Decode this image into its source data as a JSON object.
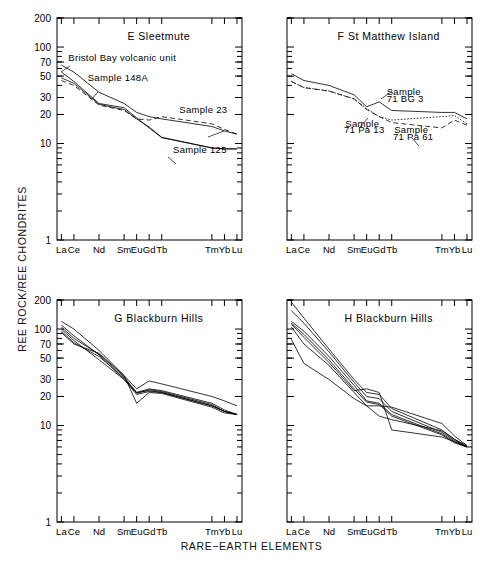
{
  "figure": {
    "xlabel": "RARE−EARTH ELEMENTS",
    "ylabel": "REE ROCK/REE CHONDRITES"
  },
  "axis": {
    "y_tick_labels": [
      "200",
      "100",
      "70",
      "50",
      "30",
      "20",
      "10",
      "1"
    ],
    "y_tick_values": [
      200,
      100,
      70,
      50,
      30,
      20,
      10,
      1
    ],
    "ylim": [
      1,
      200
    ],
    "yscale": "log",
    "x_tick_labels": [
      "La",
      "Ce",
      "Nd",
      "Sm",
      "Eu",
      "Gd",
      "Tb",
      "Tm",
      "Yb",
      "Lu"
    ],
    "x_positions": [
      0,
      1,
      3,
      5,
      6,
      7,
      8,
      12,
      13,
      14
    ],
    "xlim": [
      -0.35,
      14.4
    ]
  },
  "chart_data": [
    {
      "type": "line",
      "panel": "E",
      "title": "E   Sleetmute",
      "xlabel": "RARE−EARTH ELEMENTS",
      "ylabel": "REE ROCK/REE CHONDRITES",
      "yscale": "log",
      "ylim": [
        1,
        200
      ],
      "grid": false,
      "categories": [
        "La",
        "Ce",
        "Nd",
        "Sm",
        "Eu",
        "Gd",
        "Tb",
        "Tm",
        "Yb",
        "Lu"
      ],
      "annotations": [
        {
          "text": "Bristol Bay volcanic unit",
          "x": 0.55,
          "y": 72
        },
        {
          "text": "Sample 148A",
          "x": 2.1,
          "y": 44
        },
        {
          "text": "Sample 23",
          "x": 9.4,
          "y": 20.5
        },
        {
          "text": "Sample 125",
          "x": 8.9,
          "y": 8.0
        }
      ],
      "series": [
        {
          "name": "Bristol Bay volcanic unit",
          "style": "solid",
          "values": [
            65,
            55,
            34,
            26,
            21,
            19,
            18,
            15,
            13.5,
            12.5
          ]
        },
        {
          "name": "Sample 148A",
          "style": "solid",
          "values": [
            55,
            44,
            26,
            23.5,
            18.5,
            14.5,
            11.5,
            9.0,
            8.8,
            8.8
          ]
        },
        {
          "name": "Sample 23",
          "style": "dashed",
          "values": [
            45,
            40,
            25,
            22,
            18,
            17.5,
            19,
            16,
            14,
            12.5
          ]
        },
        {
          "name": "Sample 125",
          "style": "solid",
          "values": [
            48,
            42,
            25.5,
            22.5,
            18,
            14.8,
            11.6,
            9.0,
            8.8,
            8.8
          ]
        }
      ]
    },
    {
      "type": "line",
      "panel": "F",
      "title": "F  St  Matthew Island",
      "yscale": "log",
      "ylim": [
        1,
        200
      ],
      "grid": false,
      "categories": [
        "La",
        "Ce",
        "Nd",
        "Sm",
        "Eu",
        "Gd",
        "Tb",
        "Tm",
        "Yb",
        "Lu"
      ],
      "annotations": [
        {
          "text": "Sample",
          "x": 7.6,
          "y": 32
        },
        {
          "text": "71 BG 3",
          "x": 7.6,
          "y": 27
        },
        {
          "text": "Sample",
          "x": 4.3,
          "y": 15
        },
        {
          "text": "71 Pa 13",
          "x": 4.2,
          "y": 13
        },
        {
          "text": "Sample",
          "x": 8.2,
          "y": 12.8
        },
        {
          "text": "71 Pa 61",
          "x": 8.1,
          "y": 11
        }
      ],
      "series": [
        {
          "name": "71 BG 3",
          "style": "solid",
          "values": [
            53,
            45,
            40,
            32,
            24,
            27,
            22,
            21,
            21,
            18
          ]
        },
        {
          "name": "71 Pa 13",
          "style": "dotted",
          "values": [
            44,
            38,
            35,
            29,
            23,
            19,
            17.5,
            19,
            19.5,
            16
          ]
        },
        {
          "name": "71 Pa 61",
          "style": "dashed",
          "values": [
            44,
            38,
            35,
            29,
            22.5,
            19,
            16.5,
            14.5,
            17.5,
            15.5
          ]
        }
      ]
    },
    {
      "type": "line",
      "panel": "G",
      "title": "G  Blackburn Hills",
      "yscale": "log",
      "ylim": [
        1,
        200
      ],
      "grid": false,
      "categories": [
        "La",
        "Ce",
        "Nd",
        "Sm",
        "Eu",
        "Gd",
        "Tb",
        "Tm",
        "Yb",
        "Lu"
      ],
      "annotations": [],
      "series": [
        {
          "name": "G-1",
          "style": "solid",
          "values": [
            120,
            100,
            60,
            33,
            24,
            29,
            27,
            20,
            18,
            16
          ]
        },
        {
          "name": "G-2",
          "style": "solid",
          "values": [
            105,
            80,
            55,
            32,
            22,
            24,
            23,
            17,
            14.5,
            13
          ]
        },
        {
          "name": "G-3",
          "style": "solid",
          "values": [
            95,
            72,
            52,
            31,
            21.5,
            23.5,
            22.5,
            16.5,
            14,
            13
          ]
        },
        {
          "name": "G-4",
          "style": "solid",
          "values": [
            100,
            76,
            48,
            30,
            21,
            22.5,
            22,
            16,
            14,
            13
          ]
        },
        {
          "name": "G-5",
          "style": "solid",
          "values": [
            92,
            70,
            56,
            33,
            17,
            22,
            21.5,
            15.5,
            13.5,
            13
          ]
        },
        {
          "name": "G-6",
          "style": "solid",
          "values": [
            110,
            85,
            54,
            30,
            22,
            23,
            22,
            16,
            14,
            13
          ]
        }
      ]
    },
    {
      "type": "line",
      "panel": "H",
      "title": "H  Blackburn Hills",
      "yscale": "log",
      "ylim": [
        1,
        200
      ],
      "grid": false,
      "categories": [
        "La",
        "Ce",
        "Nd",
        "Sm",
        "Eu",
        "Gd",
        "Tb",
        "Tm",
        "Yb",
        "Lu"
      ],
      "annotations": [],
      "series": [
        {
          "name": "H-1",
          "style": "solid",
          "values": [
            190,
            130,
            62,
            30,
            22,
            21,
            15,
            9.0,
            7.2,
            6.2
          ]
        },
        {
          "name": "H-2",
          "style": "solid",
          "values": [
            155,
            115,
            58,
            28,
            20,
            19,
            14,
            8.5,
            7.0,
            6.0
          ]
        },
        {
          "name": "H-3",
          "style": "solid",
          "values": [
            120,
            95,
            52,
            26,
            18,
            17,
            13,
            8.2,
            6.8,
            6.0
          ]
        },
        {
          "name": "H-4",
          "style": "solid",
          "values": [
            115,
            88,
            48,
            24,
            17.5,
            16.5,
            12.5,
            8.0,
            6.6,
            6.0
          ]
        },
        {
          "name": "H-5",
          "style": "solid",
          "values": [
            105,
            70,
            42,
            22,
            16,
            12.5,
            11.5,
            8.8,
            7.2,
            6.0
          ]
        },
        {
          "name": "H-6",
          "style": "solid",
          "values": [
            78,
            44,
            30,
            19,
            16,
            16,
            15.5,
            10.5,
            7.8,
            6.2
          ]
        },
        {
          "name": "H-7",
          "style": "solid",
          "values": [
            112,
            82,
            45,
            23,
            24,
            22,
            9.0,
            7.6,
            6.8,
            6.0
          ]
        }
      ]
    }
  ]
}
